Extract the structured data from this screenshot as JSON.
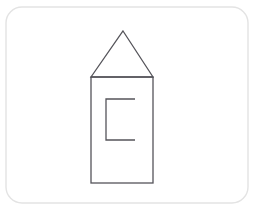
{
  "canvas": {
    "width": 255,
    "height": 215,
    "background_color": "#ffffff",
    "title": "House outline line drawing"
  },
  "frame": {
    "name": "rounded-rectangle-border",
    "x": 6,
    "y": 7,
    "width": 242,
    "height": 196,
    "corner_radius": 16,
    "stroke_color": "#e3e3e3",
    "stroke_width": 1.4,
    "fill_color": "#ffffff"
  },
  "figure": {
    "label": "house",
    "stroke_color": "#55545a",
    "stroke_width": 1.3,
    "parts": [
      {
        "name": "roof-triangle",
        "type": "polygon",
        "points": "123,31 153,77 91,77",
        "apex": [
          123,
          31
        ],
        "base_left": [
          91,
          77
        ],
        "base_right": [
          153,
          77
        ]
      },
      {
        "name": "body-rectangle",
        "type": "rect",
        "x": 91,
        "y": 77,
        "width": 62,
        "height": 106
      },
      {
        "name": "inner-bracket",
        "type": "polyline",
        "points": "135,99 106,99 106,140 135,140",
        "description": "C-shaped bracket open toward the right"
      }
    ]
  }
}
